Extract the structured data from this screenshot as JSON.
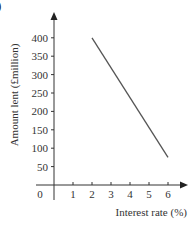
{
  "figure": {
    "corner_label": ")"
  },
  "chart_data": {
    "type": "line",
    "title": "",
    "xlabel": "Interest rate (%)",
    "ylabel": "Amount lent (£million)",
    "x_ticks": [
      "1",
      "2",
      "3",
      "4",
      "5",
      "6"
    ],
    "y_ticks": [
      "50",
      "100",
      "150",
      "200",
      "250",
      "300",
      "350",
      "400"
    ],
    "origin_label": "0",
    "xlim": [
      0,
      6.5
    ],
    "ylim": [
      0,
      430
    ],
    "grid": false,
    "legend": null,
    "series": [
      {
        "name": "Amount lent",
        "x": [
          2,
          6
        ],
        "y": [
          400,
          75
        ],
        "color": "#555555"
      }
    ]
  }
}
